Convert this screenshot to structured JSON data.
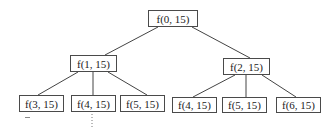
{
  "diagram": {
    "type": "recursion-tree",
    "nodes": [
      {
        "id": "n0",
        "label": "f(0, 15)",
        "x": 148,
        "y": 10,
        "w": 50,
        "h": 17
      },
      {
        "id": "n1",
        "label": "f(1, 15)",
        "x": 70,
        "y": 55,
        "w": 47,
        "h": 17
      },
      {
        "id": "n2",
        "label": "f(2, 15)",
        "x": 223,
        "y": 58,
        "w": 47,
        "h": 17
      },
      {
        "id": "n3",
        "label": "f(3, 15)",
        "x": 19,
        "y": 95,
        "w": 45,
        "h": 17
      },
      {
        "id": "n4",
        "label": "f(4, 15)",
        "x": 71,
        "y": 95,
        "w": 45,
        "h": 17
      },
      {
        "id": "n5",
        "label": "f(5, 15)",
        "x": 120,
        "y": 95,
        "w": 45,
        "h": 17
      },
      {
        "id": "n6",
        "label": "f(4, 15)",
        "x": 172,
        "y": 97,
        "w": 45,
        "h": 16
      },
      {
        "id": "n7",
        "label": "f(5, 15)",
        "x": 222,
        "y": 97,
        "w": 45,
        "h": 16
      },
      {
        "id": "n8",
        "label": "f(6, 15)",
        "x": 276,
        "y": 97,
        "w": 45,
        "h": 16
      }
    ],
    "edges": [
      {
        "from": "n0",
        "to": "n1",
        "x1": 158,
        "y1": 27,
        "x2": 105,
        "y2": 55
      },
      {
        "from": "n0",
        "to": "n2",
        "x1": 192,
        "y1": 27,
        "x2": 250,
        "y2": 58
      },
      {
        "from": "n1",
        "to": "n3",
        "x1": 78,
        "y1": 72,
        "x2": 38,
        "y2": 95
      },
      {
        "from": "n1",
        "to": "n4",
        "x1": 93,
        "y1": 72,
        "x2": 93,
        "y2": 95
      },
      {
        "from": "n1",
        "to": "n5",
        "x1": 108,
        "y1": 72,
        "x2": 147,
        "y2": 95
      },
      {
        "from": "n2",
        "to": "n6",
        "x1": 235,
        "y1": 75,
        "x2": 193,
        "y2": 97
      },
      {
        "from": "n2",
        "to": "n7",
        "x1": 246,
        "y1": 75,
        "x2": 246,
        "y2": 97
      },
      {
        "from": "n2",
        "to": "n8",
        "x1": 262,
        "y1": 75,
        "x2": 296,
        "y2": 97
      }
    ],
    "continuation_marks": [
      {
        "type": "dotted-vertical",
        "x": 92,
        "y1": 114,
        "y2": 127
      },
      {
        "type": "short-dash",
        "x": 25,
        "y": 117,
        "w": 5
      }
    ]
  }
}
